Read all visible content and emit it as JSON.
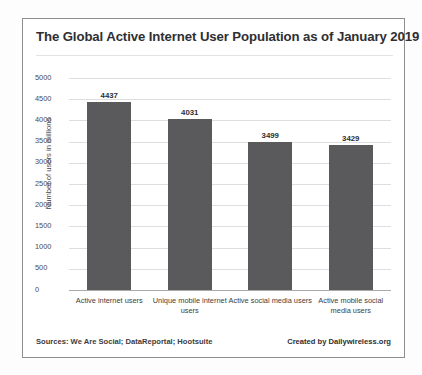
{
  "chart_data": {
    "type": "bar",
    "title": "The Global Active Internet User Population as of January 2019",
    "xlabel": "",
    "ylabel": "Number of users in millions",
    "categories": [
      "Active internet users",
      "Unique mobile internet users",
      "Active social media users",
      "Active mobile social media users"
    ],
    "values": [
      4437,
      4031,
      3499,
      3429
    ],
    "value_labels": [
      "4437",
      "4031",
      "3499",
      "3429"
    ],
    "ylim": [
      0,
      5000
    ],
    "yticks": [
      5000,
      4500,
      4000,
      3500,
      3000,
      2500,
      2000,
      1500,
      1000,
      500,
      0
    ],
    "ytick_labels": [
      "5000",
      "4500",
      "4000",
      "3500",
      "3000",
      "2500",
      "2000",
      "1500",
      "1000",
      "500",
      "0"
    ],
    "grid": true,
    "legend": false,
    "bar_color": "#5a5a5c",
    "grid_color": "#dedede",
    "axis_color": "#a8a8a8"
  },
  "footer": {
    "sources": "Sources: We Are Social; DataReportal; Hootsuite",
    "credit": "Created by Dailywireless.org"
  }
}
